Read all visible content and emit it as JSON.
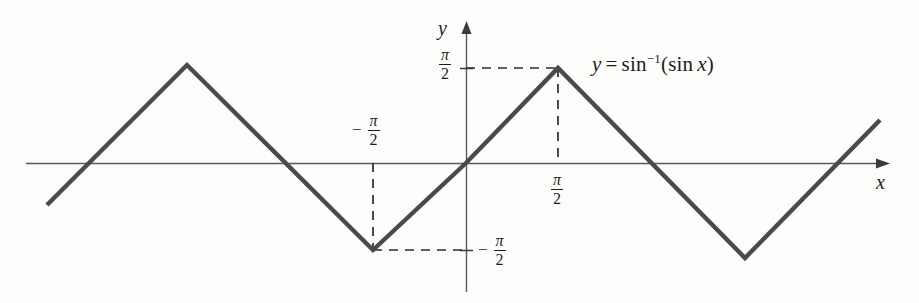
{
  "figure": {
    "title": "",
    "equation_label": {
      "lhs": "y",
      "eq": "=",
      "fn": "sin",
      "exponent": "−1",
      "arg_open": "(",
      "arg_fn": "sin",
      "arg_var": "x",
      "arg_close": ")",
      "plain": "y = sin⁻¹(sin x)"
    },
    "axes": {
      "x_label": "x",
      "y_label": "y"
    },
    "tick_labels": {
      "y_positive": {
        "sign": "",
        "numerator": "π",
        "denominator": "2",
        "plain": "π/2"
      },
      "y_negative": {
        "sign": "−",
        "numerator": "π",
        "denominator": "2",
        "plain": "−π/2"
      },
      "x_positive": {
        "sign": "",
        "numerator": "π",
        "denominator": "2",
        "plain": "π/2"
      },
      "x_negative": {
        "sign": "−",
        "numerator": "π",
        "denominator": "2",
        "plain": "−π/2"
      }
    },
    "colors": {
      "curve": "#4a4a4a",
      "axis": "#5a5a5a",
      "dashed": "#2b2b2b",
      "text": "#1d1d1d",
      "background": "#fdfdfc"
    }
  },
  "chart_data": {
    "type": "line",
    "xlabel": "x",
    "ylabel": "y",
    "xlim": [
      -4.712,
      4.712
    ],
    "ylim": [
      -2.2,
      2.2
    ],
    "grid": false,
    "legend": "none",
    "annotations": [
      {
        "text": "y = sin⁻¹(sin x)",
        "x_px": 592,
        "y_px": 66
      },
      {
        "text": "−π/2",
        "x_px": 374,
        "y_px": 130,
        "role": "x-tick-left-above-axis"
      },
      {
        "text": "π/2",
        "x_px": 560,
        "y_px": 190,
        "role": "x-tick-right-below-axis"
      },
      {
        "text": "π/2",
        "x_px": 447,
        "y_px": 60,
        "role": "y-tick-positive"
      },
      {
        "text": "−π/2",
        "x_px": 492,
        "y_px": 250,
        "role": "y-tick-negative"
      }
    ],
    "series": [
      {
        "name": "y = sin⁻¹(sin x)",
        "description": "triangle wave of amplitude π/2 and period 2π",
        "points_px": [
          [
            47,
            205
          ],
          [
            187,
            65
          ],
          [
            373,
            250
          ],
          [
            466,
            163
          ],
          [
            558,
            68
          ],
          [
            745,
            258
          ],
          [
            880,
            120
          ]
        ],
        "points_math": [
          [
            -4.45,
            -0.66
          ],
          [
            -3.14,
            1.571
          ],
          [
            -1.571,
            -1.571
          ],
          [
            0,
            0
          ],
          [
            1.571,
            1.571
          ],
          [
            4.712,
            -1.571
          ],
          [
            7.0,
            0.49
          ]
        ]
      }
    ],
    "dashed_guides": [
      {
        "from_px": [
          373,
          163
        ],
        "to_px": [
          373,
          250
        ],
        "orientation": "vertical"
      },
      {
        "from_px": [
          373,
          250
        ],
        "to_px": [
          466,
          250
        ],
        "orientation": "horizontal"
      },
      {
        "from_px": [
          466,
          68
        ],
        "to_px": [
          558,
          68
        ],
        "orientation": "horizontal"
      },
      {
        "from_px": [
          558,
          68
        ],
        "to_px": [
          558,
          163
        ],
        "orientation": "vertical"
      }
    ]
  }
}
